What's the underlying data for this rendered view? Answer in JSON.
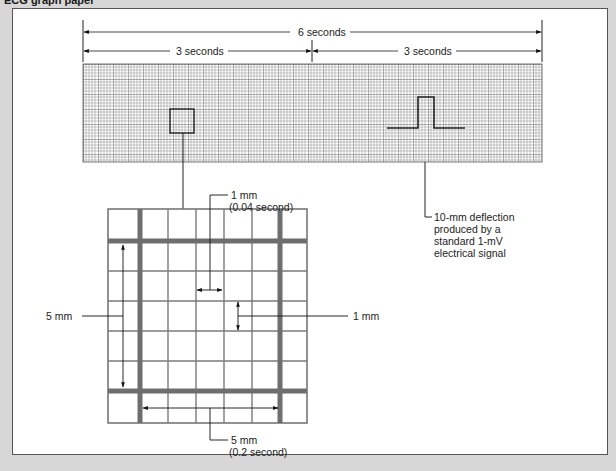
{
  "caption": "ECG graph paper",
  "strip": {
    "x": 83,
    "y": 64,
    "width": 459,
    "height": 98,
    "small_square_px": 3,
    "large_square_px": 15,
    "grid_color_minor": "#9a9a9a",
    "grid_color_major": "#555555"
  },
  "dimensions": {
    "total": "6 seconds",
    "left_half": "3 seconds",
    "right_half": "3 seconds"
  },
  "calibration": {
    "label_lines": [
      "10-mm deflection",
      "produced by a",
      "standard 1-mV",
      "electrical signal"
    ]
  },
  "enlarged_grid": {
    "columns": 7,
    "rows": 7,
    "thick_line_color": "#6e6e6e",
    "thin_line_color": "#777777"
  },
  "annotations": {
    "small_width": {
      "line1": "1 mm",
      "line2": "(0.04 second)"
    },
    "small_height": {
      "line1": "1 mm"
    },
    "large_height": {
      "line1": "5 mm"
    },
    "large_width": {
      "line1": "5 mm",
      "line2": "(0.2 second)"
    }
  }
}
